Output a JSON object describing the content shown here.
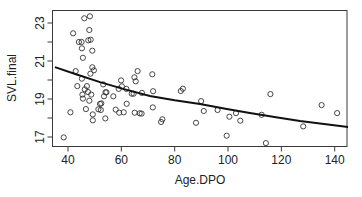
{
  "chart_data": {
    "type": "scatter",
    "title": "",
    "xlabel": "Age.DPO",
    "ylabel": "SVL.final",
    "xlim": [
      34.5,
      145.2
    ],
    "ylim": [
      16.55,
      23.7
    ],
    "x_ticks": [
      40,
      60,
      80,
      100,
      120,
      140
    ],
    "y_ticks": [
      17,
      19,
      21,
      23
    ],
    "y_minor_ticks": [
      18,
      20,
      22
    ],
    "grid": false,
    "legend": null,
    "series": [
      {
        "name": "observations",
        "marker": "open-circle",
        "points": [
          [
            46.1,
            23.25
          ],
          [
            48.2,
            23.35
          ],
          [
            41.9,
            22.46
          ],
          [
            48.0,
            22.63
          ],
          [
            44.1,
            22.0
          ],
          [
            45.1,
            22.0
          ],
          [
            47.6,
            22.09
          ],
          [
            48.5,
            22.12
          ],
          [
            45.2,
            21.67
          ],
          [
            49.1,
            21.54
          ],
          [
            45.6,
            21.17
          ],
          [
            42.9,
            20.47
          ],
          [
            49.1,
            20.67
          ],
          [
            49.7,
            20.51
          ],
          [
            48.4,
            20.33
          ],
          [
            45.2,
            20.07
          ],
          [
            43.5,
            19.68
          ],
          [
            47.1,
            19.68
          ],
          [
            46.3,
            19.51
          ],
          [
            47.5,
            19.37
          ],
          [
            45.4,
            19.23
          ],
          [
            48.7,
            19.23
          ],
          [
            45.6,
            19.02
          ],
          [
            48.0,
            18.91
          ],
          [
            53.2,
            19.77
          ],
          [
            54.1,
            19.35
          ],
          [
            53.5,
            19.14
          ],
          [
            52.0,
            18.74
          ],
          [
            51.4,
            18.46
          ],
          [
            46.7,
            18.47
          ],
          [
            40.9,
            18.3
          ],
          [
            49.3,
            18.19
          ],
          [
            49.3,
            17.88
          ],
          [
            54.0,
            17.98
          ],
          [
            38.4,
            16.98
          ],
          [
            54.4,
            19.35
          ],
          [
            57.0,
            19.14
          ],
          [
            59.9,
            19.98
          ],
          [
            64.9,
            20.14
          ],
          [
            66.1,
            20.47
          ],
          [
            65.4,
            19.93
          ],
          [
            71.6,
            20.3
          ],
          [
            59.0,
            19.53
          ],
          [
            60.2,
            19.67
          ],
          [
            61.9,
            19.53
          ],
          [
            63.9,
            19.28
          ],
          [
            64.6,
            19.28
          ],
          [
            67.7,
            19.32
          ],
          [
            71.9,
            19.41
          ],
          [
            62.0,
            18.75
          ],
          [
            57.9,
            18.44
          ],
          [
            59.2,
            18.28
          ],
          [
            60.9,
            18.3
          ],
          [
            65.0,
            18.28
          ],
          [
            66.9,
            18.25
          ],
          [
            67.6,
            18.23
          ],
          [
            71.8,
            18.56
          ],
          [
            75.4,
            17.93
          ],
          [
            74.9,
            17.79
          ],
          [
            52.5,
            18.77
          ],
          [
            52.3,
            18.42
          ],
          [
            82.3,
            19.42
          ],
          [
            83.1,
            19.54
          ],
          [
            89.9,
            18.89
          ],
          [
            90.9,
            18.37
          ],
          [
            88.0,
            17.75
          ],
          [
            96.1,
            18.42
          ],
          [
            100.5,
            18.07
          ],
          [
            103.0,
            18.26
          ],
          [
            104.6,
            17.86
          ],
          [
            99.5,
            17.07
          ],
          [
            112.6,
            18.17
          ],
          [
            115.9,
            19.26
          ],
          [
            114.2,
            16.68
          ],
          [
            128.2,
            17.56
          ],
          [
            135.1,
            18.68
          ],
          [
            140.9,
            18.26
          ]
        ]
      },
      {
        "name": "fitted curve",
        "type": "line",
        "points": [
          [
            35.1,
            20.68
          ],
          [
            43,
            20.3
          ],
          [
            52,
            19.89
          ],
          [
            61,
            19.52
          ],
          [
            70.7,
            19.16
          ],
          [
            80,
            18.93
          ],
          [
            89.5,
            18.74
          ],
          [
            99,
            18.49
          ],
          [
            108.2,
            18.26
          ],
          [
            118,
            18.04
          ],
          [
            127,
            17.84
          ],
          [
            136,
            17.68
          ],
          [
            145,
            17.53
          ]
        ]
      }
    ]
  }
}
